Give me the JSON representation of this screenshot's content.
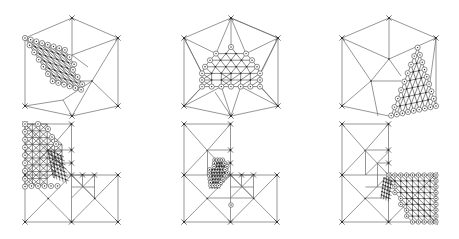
{
  "figure": {
    "colors": {
      "background": "#ffffff",
      "edge": "#6a6a6a",
      "fine_edge": "#3a3a3a",
      "node": "#222222"
    },
    "panels": [
      {
        "id": "hex-refine-upper-left",
        "domain": "hexagon",
        "hull": [
          [
            72,
            18
          ],
          [
            118,
            38
          ],
          [
            118,
            106
          ],
          [
            72,
            116
          ],
          [
            25,
            106
          ],
          [
            25,
            38
          ]
        ],
        "center": [
          92,
          81
        ],
        "refine": {
          "type": "parallelogram",
          "origin": [
            25,
            38
          ],
          "u": [
            5.7,
            1.7
          ],
          "v": [
            4.6,
            7.2
          ],
          "nu": 7,
          "nv": 6
        },
        "links": [
          [
            72,
            18
          ],
          [
            72,
            55
          ],
          [
            118,
            38
          ],
          [
            92,
            81
          ],
          [
            118,
            106
          ],
          [
            72,
            116
          ],
          [
            25,
            106
          ],
          [
            63,
            100
          ]
        ]
      },
      {
        "id": "hex-refine-center",
        "domain": "hexagon",
        "hull": [
          [
            231,
            18
          ],
          [
            278,
            38
          ],
          [
            278,
            106
          ],
          [
            231,
            116
          ],
          [
            184,
            106
          ],
          [
            184,
            38
          ]
        ],
        "refine": {
          "type": "trapezoid",
          "top": [
            231,
            47
          ],
          "rows": 7,
          "dx": 5.1,
          "dy": 6.6
        },
        "links": [
          [
            231,
            18
          ],
          [
            231,
            47
          ],
          [
            184,
            38
          ],
          [
            201,
            71
          ],
          [
            278,
            38
          ],
          [
            262,
            71
          ],
          [
            184,
            106
          ],
          [
            201,
            88
          ],
          [
            278,
            106
          ],
          [
            262,
            88
          ],
          [
            231,
            116
          ],
          [
            215,
            92
          ],
          [
            247,
            92
          ]
        ]
      },
      {
        "id": "hex-refine-lower-right",
        "domain": "hexagon",
        "hull": [
          [
            389,
            18
          ],
          [
            436,
            38
          ],
          [
            436,
            106
          ],
          [
            389,
            116
          ],
          [
            342,
            106
          ],
          [
            342,
            38
          ]
        ],
        "center": [
          389,
          59
        ],
        "mid": [
          371,
          81
        ],
        "refine": {
          "type": "triangle",
          "origin": [
            436,
            106
          ],
          "u": [
            -5.2,
            1.4
          ],
          "v": [
            -2.4,
            -7.4
          ],
          "n": 8
        },
        "links": [
          [
            389,
            18
          ],
          [
            389,
            59
          ],
          [
            342,
            38
          ],
          [
            389,
            59
          ],
          [
            436,
            38
          ],
          [
            389,
            59
          ],
          [
            342,
            38
          ],
          [
            371,
            81
          ],
          [
            342,
            106
          ],
          [
            371,
            81
          ],
          [
            389,
            59
          ],
          [
            371,
            81
          ],
          [
            371,
            81
          ],
          [
            405,
            81
          ],
          [
            371,
            81
          ],
          [
            377,
            116
          ]
        ]
      },
      {
        "id": "L-refine-left-edge",
        "domain": "L-shape",
        "hull": [
          [
            25,
            124
          ],
          [
            72,
            124
          ],
          [
            72,
            175
          ],
          [
            118,
            175
          ],
          [
            118,
            222
          ],
          [
            25,
            222
          ]
        ],
        "refine_center": [
          60,
          170
        ],
        "refine_side": "left"
      },
      {
        "id": "L-refine-corner",
        "domain": "L-shape",
        "hull": [
          [
            184,
            124
          ],
          [
            231,
            124
          ],
          [
            231,
            175
          ],
          [
            278,
            175
          ],
          [
            278,
            222
          ],
          [
            184,
            222
          ]
        ],
        "refine_center": [
          225,
          185
        ],
        "refine_side": "corner"
      },
      {
        "id": "L-refine-lower-right-edge",
        "domain": "L-shape",
        "hull": [
          [
            342,
            124
          ],
          [
            389,
            124
          ],
          [
            389,
            175
          ],
          [
            436,
            175
          ],
          [
            436,
            222
          ],
          [
            342,
            222
          ]
        ],
        "refine_center": [
          410,
          178
        ],
        "refine_side": "right"
      }
    ]
  }
}
